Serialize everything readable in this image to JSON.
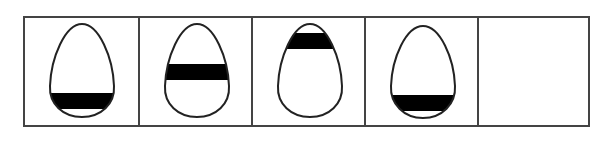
{
  "puzzle": {
    "type": "figure-sequence",
    "panel_count": 5,
    "stroke_color": "#444444",
    "fill_color": "#000000",
    "panels": [
      {
        "index": 1,
        "shape": "egg",
        "orientation": "wide-bottom",
        "band": "near-bottom"
      },
      {
        "index": 2,
        "shape": "egg",
        "orientation": "wide-bottom",
        "band": "middle"
      },
      {
        "index": 3,
        "shape": "egg",
        "orientation": "wide-bottom",
        "band": "near-top"
      },
      {
        "index": 4,
        "shape": "egg",
        "orientation": "wide-bottom",
        "band": "near-bottom"
      },
      {
        "index": 5,
        "shape": "empty",
        "orientation": "",
        "band": ""
      }
    ]
  }
}
